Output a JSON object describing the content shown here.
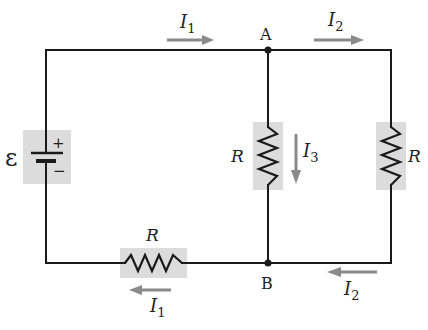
{
  "diagram": {
    "type": "circuit",
    "colors": {
      "wire": "#1a1a1a",
      "component_shade": "#dcdcdc",
      "current_arrow": "#8a8a8a",
      "background": "#ffffff"
    },
    "battery": {
      "symbol": "ε",
      "plus": "+",
      "minus": "−"
    },
    "nodes": {
      "a": "A",
      "b": "B"
    },
    "resistors": {
      "middle": "R",
      "right": "R",
      "bottom": "R"
    },
    "currents": {
      "top_left": {
        "name": "I",
        "sub": "1"
      },
      "top_right": {
        "name": "I",
        "sub": "2"
      },
      "middle": {
        "name": "I",
        "sub": "3"
      },
      "bottom_left": {
        "name": "I",
        "sub": "1"
      },
      "bottom_right": {
        "name": "I",
        "sub": "2"
      }
    }
  }
}
